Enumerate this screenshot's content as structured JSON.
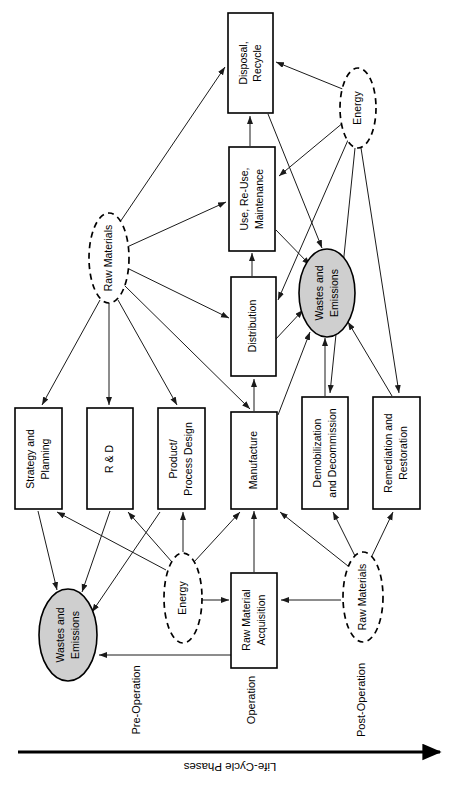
{
  "diagram": {
    "axis": {
      "label": "Life-Cycle Phases",
      "direction": "right"
    },
    "phases": [
      {
        "id": "pre-operation",
        "label": "Pre-Operation"
      },
      {
        "id": "operation",
        "label": "Operation"
      },
      {
        "id": "post-operation",
        "label": "Post-Operation"
      }
    ],
    "process_boxes": [
      {
        "id": "strategy-and-planning",
        "label": "Strategy and Planning",
        "line1": "Strategy and",
        "line2": "Planning"
      },
      {
        "id": "r-and-d",
        "label": "R & D",
        "line1": "R & D",
        "line2": ""
      },
      {
        "id": "product-process-design",
        "label": "Product/ Process Design",
        "line1": "Product/",
        "line2": "Process Design"
      },
      {
        "id": "manufacture",
        "label": "Manufacture",
        "line1": "Manufacture",
        "line2": ""
      },
      {
        "id": "demobilization-and-decommission",
        "label": "Demobilization and Decommission",
        "line1": "Demobilization",
        "line2": "and Decommission"
      },
      {
        "id": "remediation-and-restoration",
        "label": "Remediation and Restoration",
        "line1": "Remediation and",
        "line2": "Restoration"
      },
      {
        "id": "raw-material-acquisition",
        "label": "Raw Material Acquisition",
        "line1": "Raw Material",
        "line2": "Acquisition"
      },
      {
        "id": "distribution",
        "label": "Distribution",
        "line1": "Distribution",
        "line2": ""
      },
      {
        "id": "use-reuse-maintenance",
        "label": "Use, Re-Use, Maintenance",
        "line1": "Use, Re-Use,",
        "line2": "Maintenance"
      },
      {
        "id": "disposal-recycle",
        "label": "Disposal, Recycle",
        "line1": "Disposal,",
        "line2": "Recycle"
      }
    ],
    "input_ellipses": [
      {
        "id": "raw-materials-upper",
        "label": "Raw Materials"
      },
      {
        "id": "raw-materials-lower",
        "label": "Raw Materials"
      },
      {
        "id": "energy-upper",
        "label": "Energy"
      },
      {
        "id": "energy-lower",
        "label": "Energy"
      }
    ],
    "output_ellipses": [
      {
        "id": "wastes-and-emissions-upper",
        "label": "Wastes and Emissions",
        "line1": "Wastes and",
        "line2": "Emissions"
      },
      {
        "id": "wastes-and-emissions-lower",
        "label": "Wastes and Emissions",
        "line1": "Wastes and",
        "line2": "Emissions"
      }
    ],
    "colors": {
      "shaded_fill": "#cfcfcf",
      "stroke": "#000000",
      "background": "#ffffff"
    }
  }
}
